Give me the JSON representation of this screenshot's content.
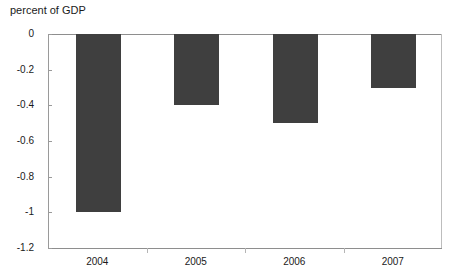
{
  "chart_data": {
    "type": "bar",
    "title": "percent of GDP",
    "xlabel": "",
    "ylabel": "percent of GDP",
    "categories": [
      "2004",
      "2005",
      "2006",
      "2007"
    ],
    "values": [
      -1.0,
      -0.4,
      -0.5,
      -0.3
    ],
    "series": [
      {
        "name": "percent of GDP",
        "values": [
          -1.0,
          -0.4,
          -0.5,
          -0.3
        ]
      }
    ],
    "ylim": [
      -1.2,
      0
    ],
    "ytick_labels": [
      "0",
      "-0.2",
      "-0.4",
      "-0.6",
      "-0.8",
      "-1",
      "-1.2"
    ],
    "ytick_values": [
      0,
      -0.2,
      -0.4,
      -0.6,
      -0.8,
      -1.0,
      -1.2
    ],
    "grid": false,
    "legend": "none",
    "bar_color": "#3f3f3f",
    "axis_color": "#8e8e8e",
    "background": "#ffffff"
  }
}
